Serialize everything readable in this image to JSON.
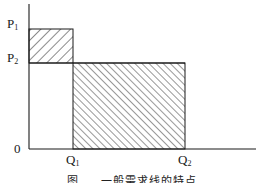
{
  "diagram": {
    "type": "price-quantity rectangle diagram",
    "origin_label": "0",
    "y_labels": [
      {
        "base": "P",
        "sub": "1"
      },
      {
        "base": "P",
        "sub": "2"
      }
    ],
    "x_labels": [
      {
        "base": "Q",
        "sub": "1"
      },
      {
        "base": "Q",
        "sub": "2"
      }
    ],
    "regions": [
      {
        "name": "upper-small-rect",
        "from": "P2 to P1",
        "span": "0 to Q1",
        "hatch": "backslash"
      },
      {
        "name": "lower-large-rect",
        "from": "0 to P2",
        "span": "Q1 to Q2",
        "hatch": "forward-slash"
      }
    ],
    "colors": {
      "line": "#1a1a1a",
      "background": "#ffffff"
    }
  },
  "caption": "图 ... 一般需求线的特点"
}
